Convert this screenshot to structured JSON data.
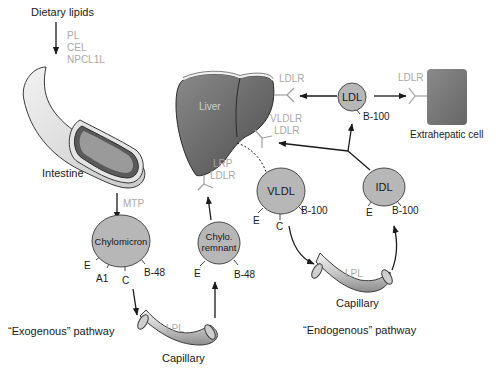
{
  "diagram": {
    "colors": {
      "lipoprotein_fill": "#b7b7b7",
      "liver_fill": "#6e6e6e",
      "extrahepatic_fill": "#7a7a7a",
      "receptor_color": "#a9a9a9",
      "text": "#1a1a1a"
    },
    "inputs": {
      "dietary_lipids": "Dietary lipids",
      "enzymes": [
        "PL",
        "CEL",
        "NPCL1L"
      ]
    },
    "organs": {
      "intestine": "Intestine",
      "liver": "Liver",
      "extrahepatic_cell": "Extrahepatic cell"
    },
    "transfer_protein": "MTP",
    "receptors": {
      "liver_ldl": "LDLR",
      "liver_vldl": [
        "VLDLR",
        "LDLR"
      ],
      "liver_remnant": [
        "LRP",
        "LDLR"
      ],
      "extrahepatic": "LDLR"
    },
    "lipoproteins": {
      "chylomicron": {
        "label": "Chylomicron",
        "apos": [
          "E",
          "A1",
          "C",
          "B-48"
        ]
      },
      "chylo_remnant": {
        "label_line1": "Chylo.",
        "label_line2": "remnant",
        "apos": [
          "E",
          "B-48"
        ]
      },
      "vldl": {
        "label": "VLDL",
        "apos": [
          "E",
          "C",
          "B-100"
        ]
      },
      "idl": {
        "label": "IDL",
        "apos": [
          "E",
          "B-100"
        ]
      },
      "ldl": {
        "label": "LDL",
        "apos": [
          "B-100"
        ]
      }
    },
    "capillaries": {
      "exogenous": {
        "label": "Capillary",
        "enzyme": "LPL"
      },
      "endogenous": {
        "label": "Capillary",
        "enzyme": "LPL"
      }
    },
    "pathways": {
      "exogenous": "“Exogenous” pathway",
      "endogenous": "“Endogenous” pathway"
    }
  }
}
